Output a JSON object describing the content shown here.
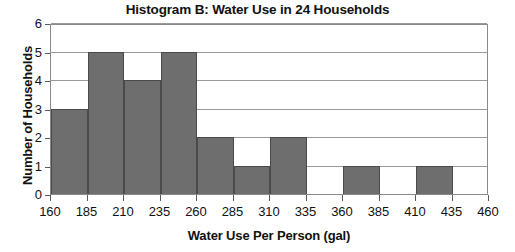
{
  "chart_data": {
    "type": "bar",
    "title": "Histogram B: Water Use in 24 Households",
    "xlabel": "Water Use Per Person (gal)",
    "ylabel": "Number of Households",
    "grid": true,
    "legend": "none",
    "bin_width": 25,
    "xlim": [
      160,
      460
    ],
    "ylim": [
      0,
      6
    ],
    "xticks": [
      160,
      185,
      210,
      235,
      260,
      285,
      310,
      335,
      360,
      385,
      410,
      435,
      460
    ],
    "yticks": [
      0,
      1,
      2,
      3,
      4,
      5,
      6
    ],
    "bin_edges": [
      160,
      185,
      210,
      235,
      260,
      285,
      310,
      335,
      360,
      385,
      410,
      435,
      460
    ],
    "categories": [
      "160-185",
      "185-210",
      "210-235",
      "235-260",
      "260-285",
      "285-310",
      "310-335",
      "335-360",
      "360-385",
      "385-410",
      "410-435",
      "435-460"
    ],
    "values": [
      3,
      5,
      4,
      5,
      2,
      1,
      2,
      0,
      1,
      0,
      1,
      0
    ],
    "total": 24,
    "bar_color": "#6e6e6e",
    "bar_edge_color": "#4a4a4a",
    "axis_color": "#8a8a8a",
    "grid_color": "#9a9a9a",
    "background": "#ffffff"
  }
}
